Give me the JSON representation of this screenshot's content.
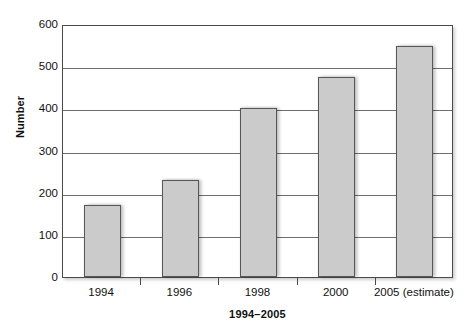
{
  "chart_data": {
    "type": "bar",
    "title": "",
    "xlabel": "1994–2005",
    "ylabel": "Number",
    "categories": [
      "1994",
      "1996",
      "1998",
      "2000",
      "2005 (estimate)"
    ],
    "values": [
      170,
      230,
      400,
      475,
      548
    ],
    "ylim": [
      0,
      600
    ],
    "ytick_labels": [
      "0",
      "100",
      "200",
      "300",
      "400",
      "500",
      "600"
    ],
    "ytick_values": [
      0,
      100,
      200,
      300,
      400,
      500,
      600
    ],
    "grid": "horizontal",
    "legend": "none",
    "series": [
      {
        "name": "Number",
        "values": [
          170,
          230,
          400,
          475,
          548
        ]
      }
    ],
    "colors": {
      "bar_fill": "#cbcbcb",
      "bar_border": "#565656",
      "gridline": "#6e6e6e",
      "frame": "#4a4a4a",
      "text": "#111111",
      "background": "#ffffff"
    }
  }
}
